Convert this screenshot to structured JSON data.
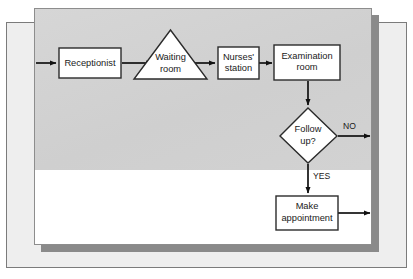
{
  "diagram": {
    "nodes": [
      {
        "id": "receptionist",
        "shape": "rectangle",
        "lines": [
          "Receptionist"
        ]
      },
      {
        "id": "waiting-room",
        "shape": "triangle",
        "lines": [
          "Waiting",
          "room"
        ]
      },
      {
        "id": "nurses-station",
        "shape": "rectangle",
        "lines": [
          "Nurses'",
          "station"
        ]
      },
      {
        "id": "examination-room",
        "shape": "rectangle",
        "lines": [
          "Examination",
          "room"
        ]
      },
      {
        "id": "follow-up",
        "shape": "diamond",
        "lines": [
          "Follow",
          "up?"
        ]
      },
      {
        "id": "make-appointment",
        "shape": "rectangle",
        "lines": [
          "Make",
          "appointment"
        ]
      }
    ],
    "edge_labels": {
      "no": "NO",
      "yes": "YES"
    }
  },
  "colors": {
    "panel_background": "#d2d2d2",
    "panel_shadow": "#8a8a8a",
    "page_background": "#eeeeee",
    "node_fill": "#ffffff",
    "node_stroke": "#2b2b2b",
    "edge_stroke": "#111111"
  }
}
